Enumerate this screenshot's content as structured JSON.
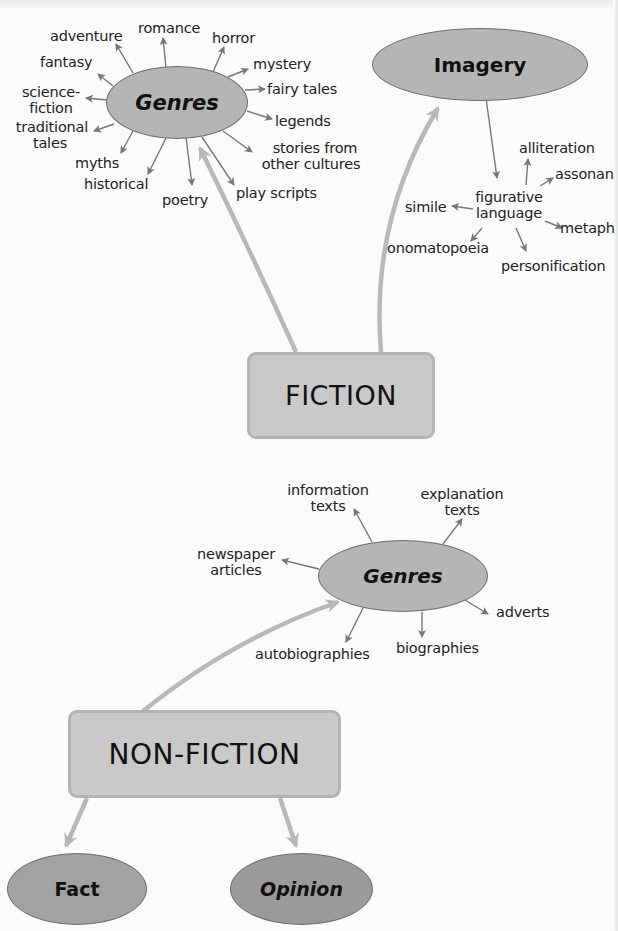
{
  "colors": {
    "background": "#fbfbfb",
    "oval_fill": "#b5b5b5",
    "oval_dark_fill": "#9d9d9d",
    "box_fill": "#c9c9c9",
    "thin_arrow": "#777777",
    "thick_arrow": "#b8b8b8",
    "text": "#222222"
  },
  "fiction": {
    "label": "FICTION",
    "genres": {
      "label": "Genres",
      "items": [
        "romance",
        "adventure",
        "horror",
        "fantasy",
        "mystery",
        "science-fiction",
        "fairy tales",
        "traditional tales",
        "legends",
        "myths",
        "stories from other cultures",
        "historical",
        "poetry",
        "play scripts"
      ]
    },
    "imagery": {
      "label": "Imagery",
      "figurative_language": {
        "label": "figurative language",
        "items": [
          "alliteration",
          "assonance",
          "simile",
          "metaphor",
          "onomatopoeia",
          "personification"
        ],
        "visible_items": {
          "alliteration": "alliteration",
          "assonance": "assonan",
          "simile": "simile",
          "metaphor": "metaph",
          "onomatopoeia": "onomatopoeia",
          "personification": "personification"
        }
      }
    }
  },
  "non_fiction": {
    "label": "NON-FICTION",
    "genres": {
      "label": "Genres",
      "items": [
        "information texts",
        "explanation texts",
        "newspaper articles",
        "adverts",
        "autobiographies",
        "biographies"
      ]
    },
    "fact": {
      "label": "Fact"
    },
    "opinion": {
      "label": "Opinion"
    }
  },
  "text_lines": {
    "romance": "romance",
    "adventure": "adventure",
    "horror": "horror",
    "fantasy": "fantasy",
    "mystery": "mystery",
    "science_1": "science-",
    "science_2": "fiction",
    "fairy": "fairy tales",
    "trad_1": "traditional",
    "trad_2": "tales",
    "legends": "legends",
    "myths": "myths",
    "stories_1": "stories from",
    "stories_2": "other cultures",
    "historical": "historical",
    "poetry": "poetry",
    "play": "play scripts",
    "fig_1": "figurative",
    "fig_2": "language",
    "info_1": "information",
    "info_2": "texts",
    "expl_1": "explanation",
    "expl_2": "texts",
    "news_1": "newspaper",
    "news_2": "articles",
    "adverts": "adverts",
    "autobio": "autobiographies",
    "bio": "biographies"
  }
}
